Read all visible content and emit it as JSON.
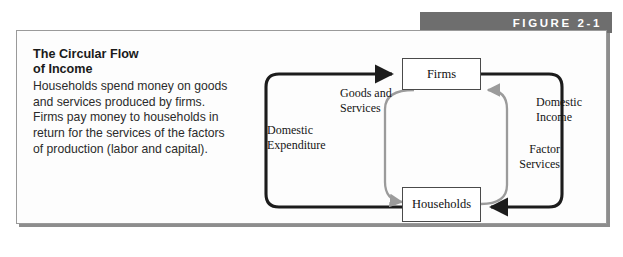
{
  "figure": {
    "banner_label": "FIGURE 2-1",
    "banner_color": "#6e6e6e",
    "frame_border_color": "#9a9a9a"
  },
  "caption": {
    "title": "The Circular Flow\nof Income",
    "body": "Households spend money on goods and services produced by firms. Firms pay money to households in return for the services of the factors of production (labor and capital)."
  },
  "diagram": {
    "nodes": [
      {
        "id": "firms",
        "label": "Firms"
      },
      {
        "id": "households",
        "label": "Households"
      }
    ],
    "flows": [
      {
        "id": "domestic-expenditure",
        "label": "Domestic\nExpenditure",
        "color": "#1c1c1c",
        "from": "households",
        "to": "firms"
      },
      {
        "id": "goods-and-services",
        "label": "Goods and\nServices",
        "color": "#9b9b9b",
        "from": "firms",
        "to": "households"
      },
      {
        "id": "factor-services",
        "label": "Factor\nServices",
        "color": "#9b9b9b",
        "from": "households",
        "to": "firms"
      },
      {
        "id": "domestic-income",
        "label": "Domestic\nIncome",
        "color": "#1c1c1c",
        "from": "firms",
        "to": "households"
      }
    ]
  }
}
